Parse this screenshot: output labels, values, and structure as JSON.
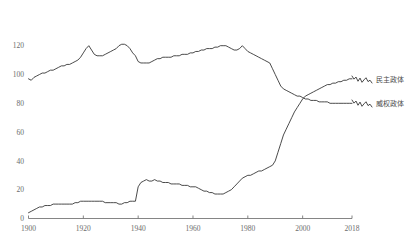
{
  "chart_data": {
    "type": "line",
    "title": "",
    "xlabel": "",
    "ylabel": "",
    "xlim": [
      1900,
      2018
    ],
    "ylim": [
      0,
      126
    ],
    "grid": false,
    "legend_position": "right",
    "x_ticks": [
      "1900",
      "1920",
      "1940",
      "1960",
      "1980",
      "2000",
      "2018"
    ],
    "x_tick_values": [
      1900,
      1920,
      1940,
      1960,
      1980,
      2000,
      2018
    ],
    "y_ticks": [
      "0",
      "20",
      "40",
      "60",
      "80",
      "100",
      "120"
    ],
    "y_tick_values": [
      0,
      20,
      40,
      60,
      80,
      100,
      120
    ],
    "series": [
      {
        "name": "民主政体",
        "color": "#2b2b2b",
        "x": [
          1900,
          1901,
          1902,
          1903,
          1904,
          1905,
          1906,
          1907,
          1908,
          1909,
          1910,
          1911,
          1912,
          1913,
          1914,
          1915,
          1916,
          1917,
          1918,
          1919,
          1920,
          1921,
          1922,
          1923,
          1924,
          1925,
          1926,
          1927,
          1928,
          1929,
          1930,
          1931,
          1932,
          1933,
          1934,
          1935,
          1936,
          1937,
          1938,
          1939,
          1940,
          1941,
          1942,
          1943,
          1944,
          1945,
          1946,
          1947,
          1948,
          1949,
          1950,
          1951,
          1952,
          1953,
          1954,
          1955,
          1956,
          1957,
          1958,
          1959,
          1960,
          1961,
          1962,
          1963,
          1964,
          1965,
          1966,
          1967,
          1968,
          1969,
          1970,
          1971,
          1972,
          1973,
          1974,
          1975,
          1976,
          1977,
          1978,
          1979,
          1980,
          1981,
          1982,
          1983,
          1984,
          1985,
          1986,
          1987,
          1988,
          1989,
          1990,
          1991,
          1992,
          1993,
          1994,
          1995,
          1996,
          1997,
          1998,
          1999,
          2000,
          2001,
          2002,
          2003,
          2004,
          2005,
          2006,
          2007,
          2008,
          2009,
          2010,
          2011,
          2012,
          2013,
          2014,
          2015,
          2016,
          2017,
          2018
        ],
        "values": [
          4,
          5,
          6,
          7,
          8,
          8,
          9,
          9,
          9,
          10,
          10,
          10,
          10,
          10,
          10,
          10,
          10,
          11,
          11,
          12,
          12,
          12,
          12,
          12,
          12,
          12,
          12,
          12,
          11,
          11,
          11,
          11,
          11,
          10,
          10,
          11,
          11,
          12,
          12,
          12,
          22,
          25,
          26,
          27,
          26,
          26,
          27,
          26,
          26,
          25,
          25,
          25,
          24,
          24,
          24,
          24,
          23,
          23,
          23,
          22,
          22,
          22,
          21,
          20,
          19,
          19,
          18,
          18,
          17,
          17,
          17,
          17,
          18,
          19,
          20,
          22,
          24,
          26,
          28,
          29,
          30,
          30,
          31,
          32,
          33,
          33,
          34,
          35,
          36,
          37,
          40,
          46,
          52,
          58,
          62,
          66,
          70,
          74,
          77,
          80,
          83,
          85,
          86,
          87,
          88,
          89,
          90,
          91,
          92,
          93,
          93,
          94,
          94,
          95,
          95,
          96,
          96,
          97,
          97
        ]
      },
      {
        "name": "威权政体",
        "color": "#2b2b2b",
        "x": [
          1900,
          1901,
          1902,
          1903,
          1904,
          1905,
          1906,
          1907,
          1908,
          1909,
          1910,
          1911,
          1912,
          1913,
          1914,
          1915,
          1916,
          1917,
          1918,
          1919,
          1920,
          1921,
          1922,
          1923,
          1924,
          1925,
          1926,
          1927,
          1928,
          1929,
          1930,
          1931,
          1932,
          1933,
          1934,
          1935,
          1936,
          1937,
          1938,
          1939,
          1940,
          1941,
          1942,
          1943,
          1944,
          1945,
          1946,
          1947,
          1948,
          1949,
          1950,
          1951,
          1952,
          1953,
          1954,
          1955,
          1956,
          1957,
          1958,
          1959,
          1960,
          1961,
          1962,
          1963,
          1964,
          1965,
          1966,
          1967,
          1968,
          1969,
          1970,
          1971,
          1972,
          1973,
          1974,
          1975,
          1976,
          1977,
          1978,
          1979,
          1980,
          1981,
          1982,
          1983,
          1984,
          1985,
          1986,
          1987,
          1988,
          1989,
          1990,
          1991,
          1992,
          1993,
          1994,
          1995,
          1996,
          1997,
          1998,
          1999,
          2000,
          2001,
          2002,
          2003,
          2004,
          2005,
          2006,
          2007,
          2008,
          2009,
          2010,
          2011,
          2012,
          2013,
          2014,
          2015,
          2016,
          2017,
          2018
        ],
        "values": [
          97,
          96,
          98,
          99,
          100,
          101,
          101,
          102,
          103,
          103,
          104,
          105,
          106,
          106,
          107,
          107,
          108,
          109,
          110,
          112,
          115,
          118,
          120,
          117,
          114,
          113,
          113,
          113,
          114,
          115,
          116,
          117,
          118,
          120,
          121,
          121,
          120,
          118,
          115,
          113,
          109,
          108,
          108,
          108,
          108,
          109,
          110,
          111,
          111,
          112,
          112,
          112,
          112,
          113,
          113,
          113,
          114,
          114,
          114,
          115,
          115,
          116,
          116,
          117,
          117,
          118,
          118,
          118,
          119,
          119,
          120,
          120,
          120,
          119,
          118,
          117,
          117,
          118,
          120,
          118,
          116,
          115,
          114,
          113,
          112,
          111,
          110,
          109,
          108,
          104,
          100,
          96,
          92,
          90,
          89,
          88,
          87,
          86,
          85,
          85,
          84,
          83,
          83,
          82,
          82,
          82,
          81,
          81,
          81,
          81,
          80,
          80,
          80,
          80,
          80,
          80,
          80,
          80,
          80
        ]
      }
    ]
  },
  "legend": {
    "entries": [
      {
        "label": "民主政体"
      },
      {
        "label": "威权政体"
      }
    ]
  }
}
